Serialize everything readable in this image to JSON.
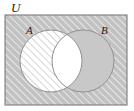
{
  "figure": {
    "type": "venn-diagram",
    "caption_labels": {
      "universe": "U",
      "set_a": "A",
      "set_b": "B"
    },
    "colors": {
      "universe_fill": "#c2c2c2",
      "universe_hatch_line": "#e8e8e8",
      "set_a_fill": "#ffffff",
      "set_a_hatch_line": "#b4b4b4",
      "set_b_fill": "#c8c8c8",
      "intersection_fill": "#ffffff",
      "outline": "#8c8c8c",
      "border": "#7d7d7d",
      "text": "#1a1a1a"
    },
    "regions": [
      {
        "name": "universe-outside-circles",
        "shading": "hatched-gray",
        "shaded": true
      },
      {
        "name": "set-a-only",
        "shading": "hatched-white",
        "shaded": true
      },
      {
        "name": "set-b-only",
        "shading": "solid-gray",
        "shaded": true
      },
      {
        "name": "a-intersect-b",
        "shading": "white",
        "shaded": false
      }
    ],
    "geometry": {
      "rect": {
        "x": 5,
        "y": 15,
        "width": 122,
        "height": 90
      },
      "circle_a": {
        "cx": 51,
        "cy": 61,
        "r": 31
      },
      "circle_b": {
        "cx": 83,
        "cy": 61,
        "r": 31
      },
      "label_u": {
        "x": 11,
        "y": 12
      },
      "label_a": {
        "x": 26,
        "y": 33
      },
      "label_b": {
        "x": 102,
        "y": 33
      }
    }
  }
}
